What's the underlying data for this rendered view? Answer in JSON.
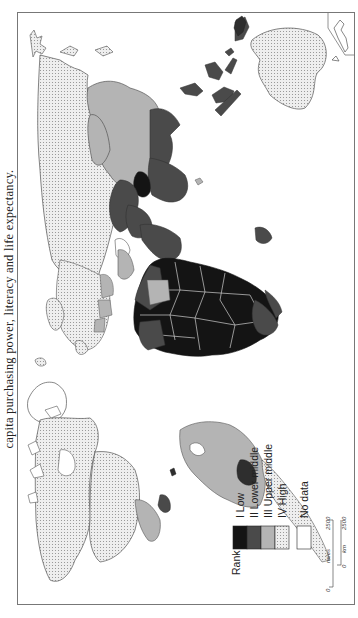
{
  "caption": {
    "text": "capita purchasing power, literacy and life expectancy."
  },
  "map": {
    "orientation": "rotated 90° counter-clockwise",
    "fill_patterns": {
      "rank_I_low": "#141414",
      "rank_II_lower_middle": "#4a4a4a",
      "rank_III_upper_middle": "#b4b4b4",
      "rank_IV_high": "dotted #e6e6e6",
      "no_data": "#ffffff"
    }
  },
  "legend": {
    "title": "Rank",
    "items": [
      {
        "label": "I  Low",
        "color": "#141414"
      },
      {
        "label": "II  Lower middle",
        "color": "#4a4a4a"
      },
      {
        "label": "III  Upper middle",
        "color": "#b4b4b4"
      },
      {
        "label": "IV  High",
        "color": "dotted"
      },
      {
        "label": "No data",
        "color": "#ffffff"
      }
    ]
  },
  "scale_bar": {
    "miles": {
      "unit": "miles",
      "start": "0",
      "end": "2500"
    },
    "km": {
      "unit": "km",
      "start": "0",
      "end": "2500"
    }
  }
}
